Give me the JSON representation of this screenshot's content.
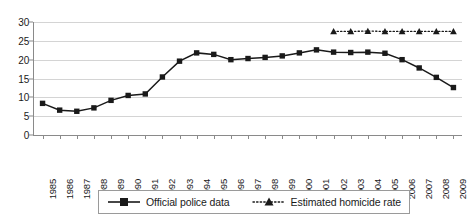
{
  "chart_data": {
    "type": "line",
    "title": "",
    "xlabel": "",
    "ylabel": "",
    "ylim": [
      0,
      30
    ],
    "yticks": [
      0,
      5,
      10,
      15,
      20,
      25,
      30
    ],
    "grid": true,
    "legend_position": "bottom",
    "categories": [
      "1985",
      "1986",
      "1987",
      "1988",
      "1989",
      "1990",
      "1991",
      "1992",
      "1993",
      "1994",
      "1995",
      "1996",
      "1997",
      "1998",
      "1999",
      "2000",
      "2001",
      "2002",
      "2003",
      "2004",
      "2005",
      "2006",
      "2007",
      "2008",
      "2009"
    ],
    "series": [
      {
        "name": "Official police data",
        "marker": "square",
        "line_style": "solid",
        "color": "#1a1a1a",
        "values": [
          8.4,
          6.6,
          6.3,
          7.2,
          9.2,
          10.5,
          10.9,
          15.4,
          19.6,
          21.8,
          21.4,
          20.0,
          20.3,
          20.6,
          21.0,
          21.8,
          22.6,
          22.0,
          21.9,
          22.0,
          21.7,
          20.0,
          17.8,
          15.3,
          12.6
        ]
      },
      {
        "name": "Estimated homicide rate",
        "marker": "triangle",
        "line_style": "dotted",
        "color": "#1a1a1a",
        "x": [
          "2002",
          "2003",
          "2004",
          "2005",
          "2006",
          "2007",
          "2008",
          "2009"
        ],
        "values": [
          27.5,
          27.5,
          27.6,
          27.5,
          27.5,
          27.5,
          27.5,
          27.5
        ]
      }
    ]
  },
  "legend": {
    "items": [
      {
        "label": "Official police data",
        "marker": "square-solid-line-swatch"
      },
      {
        "label": "Estimated homicide rate",
        "marker": "triangle-dotted-line-swatch"
      }
    ]
  }
}
